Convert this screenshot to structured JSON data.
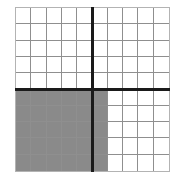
{
  "figure": {
    "background_color": "#ffffff"
  },
  "grid": {
    "columns": 10,
    "rows": 10,
    "gridline_color": "#8f8f8f",
    "border_color": "#b3b3b3",
    "cell_fill_color": "#8a8a8a",
    "empty_fill_color": "#ffffff"
  },
  "axes": {
    "vertical_axis_after_column": 5,
    "horizontal_axis_after_row": 5,
    "axis_color": "#1a1a1a",
    "axis_thickness_px": 3
  },
  "shading": {
    "shaded_rows_start": 6,
    "shaded_rows_end": 10,
    "shaded_columns_start": 1,
    "shaded_columns_end": 6,
    "shaded_cell_count": 30,
    "total_cell_count": 100,
    "fraction_shaded": "30/100"
  },
  "chart_data": {
    "type": "heatmap",
    "xlabel": "",
    "ylabel": "",
    "columns": 10,
    "rows": 10,
    "grid": [
      [
        0,
        0,
        0,
        0,
        0,
        0,
        0,
        0,
        0,
        0
      ],
      [
        0,
        0,
        0,
        0,
        0,
        0,
        0,
        0,
        0,
        0
      ],
      [
        0,
        0,
        0,
        0,
        0,
        0,
        0,
        0,
        0,
        0
      ],
      [
        0,
        0,
        0,
        0,
        0,
        0,
        0,
        0,
        0,
        0
      ],
      [
        0,
        0,
        0,
        0,
        0,
        0,
        0,
        0,
        0,
        0
      ],
      [
        1,
        1,
        1,
        1,
        1,
        1,
        0,
        0,
        0,
        0
      ],
      [
        1,
        1,
        1,
        1,
        1,
        1,
        0,
        0,
        0,
        0
      ],
      [
        1,
        1,
        1,
        1,
        1,
        1,
        0,
        0,
        0,
        0
      ],
      [
        1,
        1,
        1,
        1,
        1,
        1,
        0,
        0,
        0,
        0
      ],
      [
        1,
        1,
        1,
        1,
        1,
        1,
        0,
        0,
        0,
        0
      ]
    ],
    "legend": [
      {
        "value": 1,
        "label": "shaded",
        "color": "#8a8a8a"
      },
      {
        "value": 0,
        "label": "unshaded",
        "color": "#ffffff"
      }
    ],
    "grid_on": true,
    "legend_position": "none"
  }
}
